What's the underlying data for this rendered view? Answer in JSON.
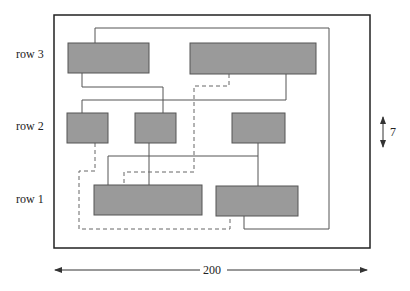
{
  "row_labels": [
    "row 3",
    "row 2",
    "row 1"
  ],
  "dimensions": {
    "width_label": "200",
    "row_height_label": "7"
  },
  "colors": {
    "block_fill": "#9a9a9a",
    "block_stroke": "#555555",
    "frame": "#222222",
    "wire": "#555555",
    "dashed_wire": "#666666"
  },
  "blocks": [
    {
      "id": "row3-a",
      "row": 3
    },
    {
      "id": "row3-b",
      "row": 3
    },
    {
      "id": "row2-a",
      "row": 2
    },
    {
      "id": "row2-b",
      "row": 2
    },
    {
      "id": "row2-c",
      "row": 2
    },
    {
      "id": "row1-a",
      "row": 1
    },
    {
      "id": "row1-b",
      "row": 1
    }
  ]
}
